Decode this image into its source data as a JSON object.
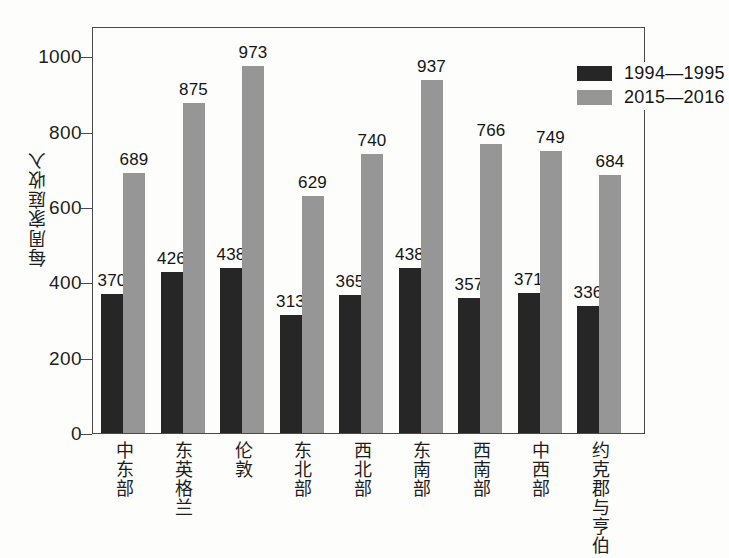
{
  "chart_data": {
    "type": "bar",
    "title": "",
    "xlabel": "",
    "ylabel": "每周家庭收入",
    "ylim": [
      0,
      1080
    ],
    "yticks": [
      0,
      200,
      400,
      600,
      800,
      1000
    ],
    "ytick_labels": [
      "0",
      "200",
      "400",
      "600",
      "800",
      "1000"
    ],
    "grid": false,
    "legend_position": "top-right",
    "categories": [
      "中东部",
      "东英格兰",
      "伦敦",
      "东北部",
      "西北部",
      "东南部",
      "西南部",
      "中西部",
      "约克郡与亨伯"
    ],
    "series": [
      {
        "name": "1994—1995",
        "color": "#262626",
        "values": [
          370,
          426,
          438,
          313,
          365,
          438,
          357,
          371,
          336
        ],
        "labels": [
          "370",
          "426",
          "438",
          "313",
          "365",
          "438",
          "357",
          "371",
          "336"
        ]
      },
      {
        "name": "2015—2016",
        "color": "#969696",
        "values": [
          689,
          875,
          973,
          629,
          740,
          937,
          766,
          749,
          684
        ],
        "labels": [
          "689",
          "875",
          "973",
          "629",
          "740",
          "937",
          "766",
          "749",
          "684"
        ]
      }
    ]
  },
  "legend": {
    "entries": [
      {
        "label": "1994—1995",
        "swatch": "dark-swatch"
      },
      {
        "label": "2015—2016",
        "swatch": "gray-swatch"
      }
    ]
  },
  "axis": {
    "y_title": "每周家庭收入"
  }
}
